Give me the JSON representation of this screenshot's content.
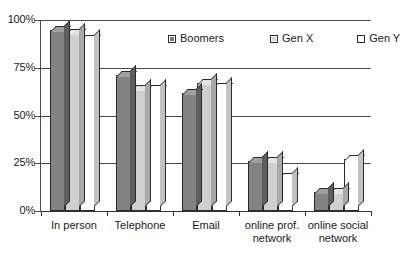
{
  "chart_data": {
    "type": "bar",
    "title": "",
    "subtitle": "",
    "xlabel": "",
    "ylabel": "",
    "ylim": [
      0,
      100
    ],
    "y_unit": "%",
    "grid": true,
    "grid_axis": "y",
    "legend_position": "top-center-inside",
    "style": "3d-column",
    "categories": [
      "In person",
      "Telephone",
      "Email",
      "online prof.\nnetwork",
      "online social\nnetwork"
    ],
    "ytick_labels": [
      "0%",
      "25%",
      "50%",
      "75%",
      "100%"
    ],
    "ytick_values": [
      0,
      25,
      50,
      75,
      100
    ],
    "series": [
      {
        "name": "Boomers",
        "color": "#838383",
        "values": [
          95,
          71,
          62,
          26,
          10
        ]
      },
      {
        "name": "Gen X",
        "color": "#cfcfcf",
        "values": [
          93,
          64,
          67,
          26,
          10
        ]
      },
      {
        "name": "Gen Y",
        "color": "#ffffff",
        "values": [
          90,
          64,
          65,
          18,
          27
        ]
      }
    ]
  },
  "legend": {
    "entries": [
      {
        "label": "Boomers"
      },
      {
        "label": "Gen X"
      },
      {
        "label": "Gen Y"
      }
    ]
  },
  "axes": {
    "y_top_label": "100%",
    "y_labels": [
      "100%",
      "75%",
      "50%",
      "25%",
      "0%"
    ]
  }
}
